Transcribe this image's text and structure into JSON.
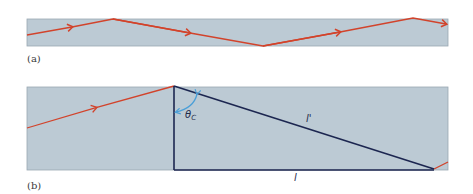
{
  "figure": {
    "panels": [
      {
        "id": "a",
        "label": "(a)",
        "description": "Light ray zig-zagging along a fiber by total internal reflection"
      },
      {
        "id": "b",
        "label": "(b)",
        "description": "Geometry of a single reflection: ray path length l' versus fiber length l at critical angle",
        "angle_label": "θ",
        "angle_subscript": "C",
        "hypotenuse_label": "l'",
        "base_label": "l"
      }
    ],
    "colors": {
      "fiber_fill": "#bccad4",
      "fiber_border": "#9aa8b2",
      "ray": "#d2432b",
      "geometry_line": "#1c2650",
      "angle_arc": "#4a9fd8"
    }
  }
}
